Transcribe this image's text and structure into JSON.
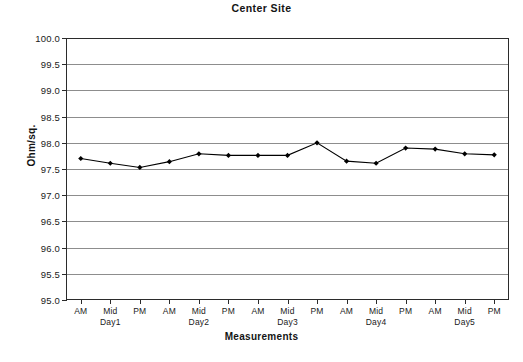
{
  "chart_data": {
    "type": "line",
    "title": "Center Site",
    "xlabel": "Measurements",
    "ylabel": "Ohm/sq.",
    "ylim": [
      95.0,
      100.0
    ],
    "ytick_labels": [
      "100.0",
      "99.5",
      "99.0",
      "98.5",
      "98.0",
      "97.5",
      "97.0",
      "96.5",
      "96.0",
      "95.5",
      "95.0"
    ],
    "ytick_values": [
      100.0,
      99.5,
      99.0,
      98.5,
      98.0,
      97.5,
      97.0,
      96.5,
      96.0,
      95.5,
      95.0
    ],
    "grid": true,
    "legend": false,
    "categories": [
      "AM",
      "Mid",
      "PM",
      "AM",
      "Mid",
      "PM",
      "AM",
      "Mid",
      "PM",
      "AM",
      "Mid",
      "PM",
      "AM",
      "Mid",
      "PM"
    ],
    "group_labels": [
      "Day1",
      "Day2",
      "Day3",
      "Day4",
      "Day5"
    ],
    "group_label_positions": [
      1,
      4,
      7,
      10,
      13
    ],
    "series": [
      {
        "name": "Center Site",
        "color": "#000000",
        "marker": "diamond",
        "values": [
          97.7,
          97.61,
          97.53,
          97.64,
          97.79,
          97.76,
          97.76,
          97.76,
          98.0,
          97.65,
          97.61,
          97.9,
          97.88,
          97.79,
          97.77
        ]
      }
    ]
  },
  "caption": {
    "text": ""
  }
}
